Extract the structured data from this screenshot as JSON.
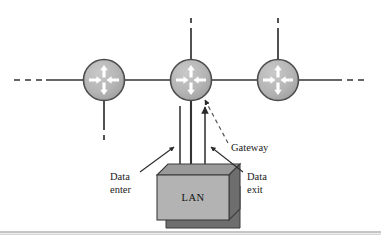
{
  "figure": {
    "name": "gateway-lan-network-diagram",
    "background_color": "#ffffff",
    "width": 381,
    "height": 240,
    "bottom_rule_color": "#808080"
  },
  "colors": {
    "router_fill": "#b3b3b3",
    "router_stroke": "#4d4d4d",
    "router_arrow": "#ffffff",
    "line": "#333333",
    "lan_front_fill": "#b3b3b3",
    "lan_top_fill": "#9a9a9a",
    "lan_side_fill": "#6e6e6e",
    "lan_stroke": "#3c3c3c",
    "text": "#1a1a1a"
  },
  "nodes": [
    {
      "id": "router-left",
      "label": "router",
      "cx": 104,
      "cy": 80,
      "r": 21,
      "stub_direction": "down",
      "stub_dashed": true
    },
    {
      "id": "router-middle",
      "label": "gateway-router",
      "cx": 191,
      "cy": 80,
      "r": 21,
      "stub_direction": "up",
      "stub_dashed": true
    },
    {
      "id": "router-right",
      "label": "router",
      "cx": 278,
      "cy": 80,
      "r": 21,
      "stub_direction": "up",
      "stub_dashed": true
    }
  ],
  "backbone": {
    "label": "network-backbone-line",
    "y": 80,
    "left_dash_start": 14,
    "right_dash_end": 367,
    "dashed_ends": true
  },
  "lan": {
    "label": "LAN",
    "x": 157,
    "y": 175,
    "width": 72,
    "height": 45,
    "depth": 11
  },
  "annotations": [
    {
      "id": "gateway-callout",
      "text": "Gateway",
      "x": 231,
      "y": 148,
      "leader": "dashed",
      "points_to": "router-middle"
    },
    {
      "id": "data-enter-callout",
      "text_lines": [
        "Data",
        "enter"
      ],
      "x": 110,
      "y": 178,
      "leader": "solid-arrow",
      "points_to": "data-enter-flow"
    },
    {
      "id": "data-exit-callout",
      "text_lines": [
        "Data",
        "exit"
      ],
      "x": 247,
      "y": 178,
      "leader": "solid-arrow",
      "points_to": "data-exit-flow"
    }
  ],
  "flows": [
    {
      "id": "data-enter-flow",
      "label": "data-enter-arrow",
      "direction": "down",
      "x": 180,
      "y_from": 106,
      "y_to": 170
    },
    {
      "id": "data-exit-flow",
      "label": "data-exit-arrow",
      "direction": "up",
      "x": 205,
      "y_from": 172,
      "y_to": 106
    }
  ]
}
